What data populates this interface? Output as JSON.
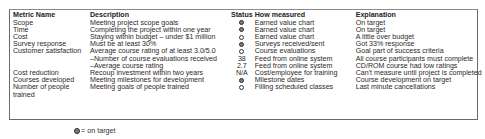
{
  "table": {
    "headers": [
      "Metric Name",
      "Description",
      "Status",
      "How measured",
      "Explanation"
    ],
    "rows": [
      {
        "metric": "Scope",
        "description": "Meeting project scope goals",
        "status": "on",
        "status_text": "",
        "measured": "Earned value chart",
        "explanation": "On target"
      },
      {
        "metric": "Time",
        "description": "Completing the project within one year",
        "status": "on",
        "status_text": "",
        "measured": "Earned value chart",
        "explanation": "On target"
      },
      {
        "metric": "Cost",
        "description": "Staying within budget – under $1 million",
        "status": "off",
        "status_text": "",
        "measured": "Earned value chart",
        "explanation": "A little over budget"
      },
      {
        "metric": "Survey response",
        "description": "Must be at least 30%",
        "status": "on",
        "status_text": "",
        "measured": "Surveys received/sent",
        "explanation": "Got 33% response"
      },
      {
        "metric": "Customer satisfaction",
        "description": "Average course rating of at least 3.0/5.0",
        "status": "off",
        "status_text": "",
        "measured": "Course evaluations",
        "explanation": "Goal part of success criteria"
      },
      {
        "metric": "",
        "description": "–Number of course evaluations received",
        "status": "text",
        "status_text": "38",
        "measured": "Feed from online system",
        "explanation": "All course participants must complete"
      },
      {
        "metric": "",
        "description": "–Average course rating",
        "status": "text",
        "status_text": "2.7",
        "measured": "Feed from online system",
        "explanation": "CD/ROM course had low ratings"
      },
      {
        "metric": "Cost reduction",
        "description": "Recoup investment within two years",
        "status": "text",
        "status_text": "N/A",
        "measured": "Cost/employee for training",
        "explanation": "Can't measure until project is completed"
      },
      {
        "metric": "Courses developed",
        "description": "Meeting milestones for development",
        "status": "on",
        "status_text": "",
        "measured": "Milestone dates",
        "explanation": "Course development on target"
      },
      {
        "metric": "Number of people",
        "description": "Meeting goals of people trained",
        "status": "off",
        "status_text": "",
        "measured": "Filling scheduled classes",
        "explanation": "Last minute cancellations"
      },
      {
        "metric": "trained",
        "description": "",
        "status": "none",
        "status_text": "",
        "measured": "",
        "explanation": ""
      }
    ]
  },
  "legend": {
    "icon": "filled-circle-icon",
    "label": "= on target"
  }
}
